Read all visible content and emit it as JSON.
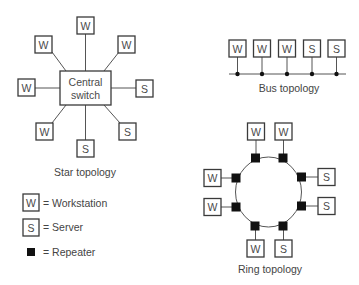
{
  "diagram": {
    "star": {
      "caption": "Star topology",
      "hub": {
        "line1": "Central",
        "line2": "switch"
      },
      "nodes": [
        {
          "label": "W",
          "type": "workstation",
          "position": "top"
        },
        {
          "label": "W",
          "type": "workstation",
          "position": "top-left"
        },
        {
          "label": "W",
          "type": "workstation",
          "position": "top-right"
        },
        {
          "label": "W",
          "type": "workstation",
          "position": "left"
        },
        {
          "label": "S",
          "type": "server",
          "position": "right"
        },
        {
          "label": "W",
          "type": "workstation",
          "position": "bottom-left"
        },
        {
          "label": "S",
          "type": "server",
          "position": "bottom-right"
        },
        {
          "label": "S",
          "type": "server",
          "position": "bottom"
        }
      ]
    },
    "bus": {
      "caption": "Bus topology",
      "nodes": [
        {
          "label": "W",
          "type": "workstation"
        },
        {
          "label": "W",
          "type": "workstation"
        },
        {
          "label": "W",
          "type": "workstation"
        },
        {
          "label": "S",
          "type": "server"
        },
        {
          "label": "S",
          "type": "server"
        }
      ]
    },
    "ring": {
      "caption": "Ring topology",
      "nodes": [
        {
          "label": "W",
          "type": "workstation",
          "position": "top-left"
        },
        {
          "label": "W",
          "type": "workstation",
          "position": "top-right"
        },
        {
          "label": "S",
          "type": "server",
          "position": "right-upper"
        },
        {
          "label": "S",
          "type": "server",
          "position": "right-lower"
        },
        {
          "label": "S",
          "type": "server",
          "position": "bottom-right"
        },
        {
          "label": "W",
          "type": "workstation",
          "position": "bottom-left"
        },
        {
          "label": "W",
          "type": "workstation",
          "position": "left-lower"
        },
        {
          "label": "W",
          "type": "workstation",
          "position": "left-upper"
        }
      ],
      "repeater_count": 8
    },
    "legend": {
      "workstation": {
        "symbol": "W",
        "text": "= Workstation"
      },
      "server": {
        "symbol": "S",
        "text": "= Server"
      },
      "repeater": {
        "text": "= Repeater"
      }
    },
    "colors": {
      "stroke": "#3a3a3a",
      "text": "#444444",
      "repeater": "#111111",
      "background": "#ffffff"
    }
  }
}
